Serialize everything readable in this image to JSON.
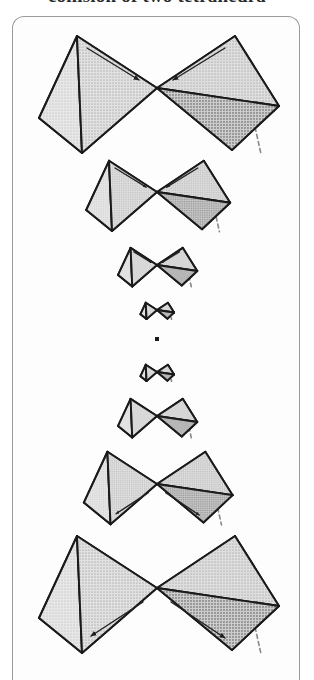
{
  "caption": {
    "text": "collision of two tetrahedra"
  },
  "plate": {
    "name": "tetrahedron-collapse-plate",
    "background": "#fdfdfd",
    "border_color": "#9b9b9b",
    "frame": {
      "x": 12,
      "y": 16,
      "width": 288,
      "height": 664,
      "corner_radius": 12
    }
  },
  "palette": {
    "outline": "#1a1a1a",
    "face_light": "#dcdcdc",
    "face_mid": "#bdbdbd",
    "face_dark": "#a6a6a6",
    "face_darker": "#8f8f8f",
    "hidden_edge": "#8a8a8a",
    "arrow": "#222222",
    "background": "#fdfdfd"
  },
  "diagram": {
    "type": "geometric-sequence",
    "motion_phases": [
      {
        "phase": "approach",
        "arrow_direction": "inward"
      },
      {
        "phase": "singular-point",
        "arrow_direction": "none"
      },
      {
        "phase": "separation",
        "arrow_direction": "outward"
      }
    ],
    "frame_count": 8,
    "frames": [
      {
        "index": 1,
        "label": "frame-1",
        "cx": 157,
        "cy": 88,
        "scale": 1.0,
        "arrows": "inward",
        "arrow_visible": true,
        "kind": "bowtie"
      },
      {
        "index": 2,
        "label": "frame-2",
        "cx": 157,
        "cy": 192,
        "scale": 0.6,
        "arrows": "inward",
        "arrow_visible": true,
        "kind": "bowtie"
      },
      {
        "index": 3,
        "label": "frame-3",
        "cx": 157,
        "cy": 265,
        "scale": 0.33,
        "arrows": "inward",
        "arrow_visible": true,
        "kind": "bowtie"
      },
      {
        "index": 4,
        "label": "frame-4",
        "cx": 157,
        "cy": 310,
        "scale": 0.14,
        "arrows": "none",
        "arrow_visible": false,
        "kind": "bowtie"
      },
      {
        "index": 5,
        "label": "frame-5",
        "cx": 157,
        "cy": 339,
        "scale": 0.0,
        "arrows": "none",
        "arrow_visible": false,
        "kind": "point"
      },
      {
        "index": 6,
        "label": "frame-6",
        "cx": 157,
        "cy": 372,
        "scale": 0.14,
        "arrows": "none",
        "arrow_visible": false,
        "kind": "bowtie"
      },
      {
        "index": 7,
        "label": "frame-7",
        "cx": 157,
        "cy": 416,
        "scale": 0.33,
        "arrows": "none",
        "arrow_visible": false,
        "kind": "bowtie"
      },
      {
        "index": 8,
        "label": "frame-8",
        "cx": 157,
        "cy": 484,
        "scale": 0.62,
        "arrows": "outward",
        "arrow_visible": true,
        "kind": "bowtie"
      },
      {
        "index": 9,
        "label": "frame-9",
        "cx": 157,
        "cy": 588,
        "scale": 1.0,
        "arrows": "outward",
        "arrow_visible": true,
        "kind": "bowtie"
      }
    ],
    "point_marker": {
      "cx": 157,
      "cy": 339,
      "size": 4,
      "color": "#1a1a1a"
    }
  }
}
